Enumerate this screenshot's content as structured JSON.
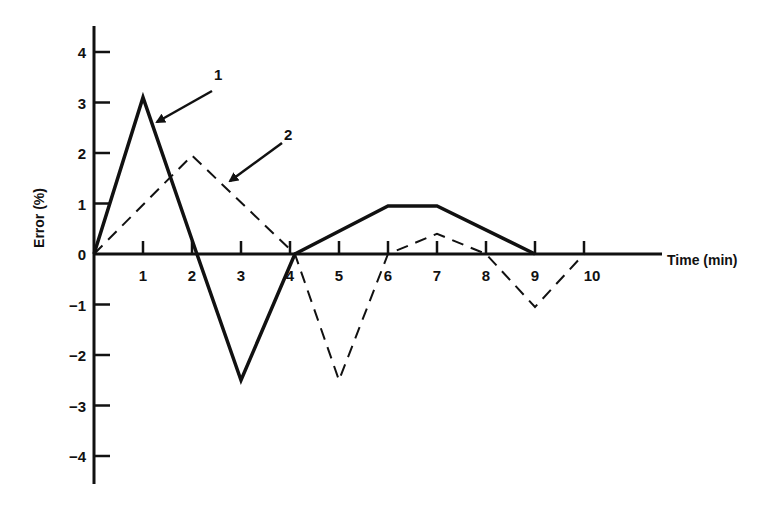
{
  "chart_data": {
    "type": "line",
    "title": "",
    "xlabel": "Time (min)",
    "ylabel": "Error (%)",
    "xlim": [
      0,
      10
    ],
    "ylim": [
      -4,
      4
    ],
    "x_ticks": [
      "1",
      "2",
      "3",
      "4",
      "5",
      "6",
      "7",
      "8",
      "9",
      "10"
    ],
    "y_ticks": [
      "4",
      "3",
      "2",
      "1",
      "0",
      "−1",
      "−2",
      "−3",
      "−4"
    ],
    "grid": false,
    "legend": "annotated arrows",
    "series": [
      {
        "name": "1",
        "style": "solid",
        "points": [
          [
            0,
            0
          ],
          [
            1,
            3.1
          ],
          [
            2.1,
            0
          ],
          [
            3,
            -2.5
          ],
          [
            4.1,
            0
          ],
          [
            6,
            0.95
          ],
          [
            7,
            0.95
          ],
          [
            9,
            0
          ]
        ]
      },
      {
        "name": "2",
        "style": "dashed",
        "points": [
          [
            0,
            0
          ],
          [
            2,
            1.95
          ],
          [
            4.1,
            0
          ],
          [
            5,
            -2.5
          ],
          [
            6,
            0
          ],
          [
            7,
            0.4
          ],
          [
            8,
            0
          ],
          [
            9,
            -1.05
          ],
          [
            10,
            0
          ]
        ]
      }
    ],
    "annotations": [
      {
        "label": "1",
        "points_to_series": "1"
      },
      {
        "label": "2",
        "points_to_series": "2"
      }
    ]
  },
  "labels": {
    "xlabel": "Time (min)",
    "ylabel": "Error (%)",
    "series1": "1",
    "series2": "2"
  }
}
